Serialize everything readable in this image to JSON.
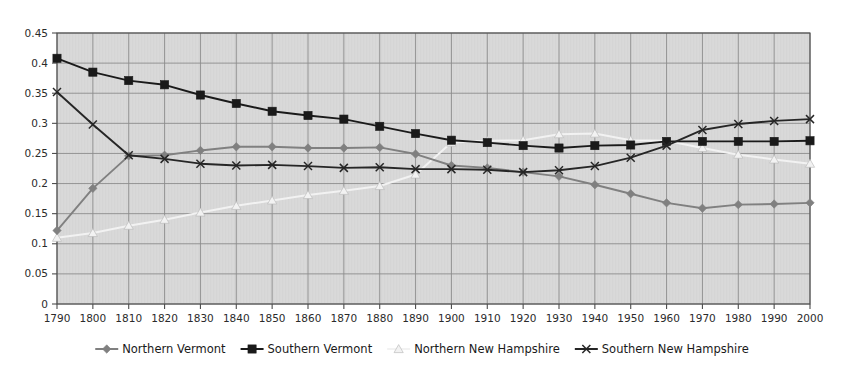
{
  "chart_data": {
    "type": "line",
    "title": "",
    "xlabel": "",
    "ylabel": "",
    "x": [
      1790,
      1800,
      1810,
      1820,
      1830,
      1840,
      1850,
      1860,
      1870,
      1880,
      1890,
      1900,
      1910,
      1920,
      1930,
      1940,
      1950,
      1960,
      1970,
      1980,
      1990,
      2000
    ],
    "xtick_labels": [
      "1790",
      "1800",
      "1810",
      "1820",
      "1830",
      "1840",
      "1850",
      "1860",
      "1870",
      "1880",
      "1890",
      "1900",
      "1910",
      "1920",
      "1930",
      "1940",
      "1950",
      "1960",
      "1970",
      "1980",
      "1990",
      "2000"
    ],
    "ytick_labels": [
      "0",
      "0.05",
      "0.1",
      "0.15",
      "0.2",
      "0.25",
      "0.3",
      "0.35",
      "0.4",
      "0.45"
    ],
    "yticks": [
      0,
      0.05,
      0.1,
      0.15,
      0.2,
      0.25,
      0.3,
      0.35,
      0.4,
      0.45
    ],
    "ylim": [
      0,
      0.45
    ],
    "xlim": [
      1790,
      2000
    ],
    "grid": true,
    "legend_position": "bottom",
    "plot_background": "#d9d9d9",
    "grid_color": "#8c8c8c",
    "series": [
      {
        "name": "Northern Vermont",
        "color": "#808080",
        "marker": "diamond",
        "values": [
          0.122,
          0.192,
          0.246,
          0.247,
          0.255,
          0.261,
          0.261,
          0.259,
          0.259,
          0.26,
          0.249,
          0.23,
          0.226,
          0.219,
          0.212,
          0.198,
          0.183,
          0.168,
          0.159,
          0.165,
          0.166,
          0.168
        ]
      },
      {
        "name": "Southern Vermont",
        "color": "#1a1a1a",
        "marker": "square",
        "values": [
          0.408,
          0.385,
          0.371,
          0.364,
          0.347,
          0.333,
          0.32,
          0.313,
          0.307,
          0.295,
          0.283,
          0.272,
          0.268,
          0.263,
          0.259,
          0.263,
          0.264,
          0.27,
          0.27,
          0.27,
          0.27,
          0.271
        ]
      },
      {
        "name": "Northern New Hampshire",
        "color": "#f2f2f2",
        "marker": "triangle",
        "values": [
          0.11,
          0.118,
          0.13,
          0.14,
          0.152,
          0.163,
          0.172,
          0.181,
          0.188,
          0.196,
          0.215,
          0.268,
          0.271,
          0.272,
          0.282,
          0.283,
          0.272,
          0.271,
          0.259,
          0.248,
          0.24,
          0.233
        ]
      },
      {
        "name": "Southern New Hampshire",
        "color": "#262626",
        "marker": "x",
        "values": [
          0.352,
          0.298,
          0.247,
          0.241,
          0.233,
          0.23,
          0.231,
          0.229,
          0.226,
          0.227,
          0.224,
          0.224,
          0.223,
          0.219,
          0.222,
          0.229,
          0.243,
          0.263,
          0.289,
          0.299,
          0.304,
          0.307
        ]
      }
    ]
  },
  "legend": {
    "items": [
      {
        "label": "Northern Vermont"
      },
      {
        "label": "Southern Vermont"
      },
      {
        "label": "Northern New Hampshire"
      },
      {
        "label": "Southern New Hampshire"
      }
    ]
  }
}
